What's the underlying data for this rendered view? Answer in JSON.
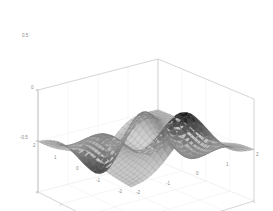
{
  "figure": {
    "title": "",
    "background_color": "#ffffff",
    "axis_line_color": "#c9c9c9",
    "grid_color": "#ededed",
    "tick_label_color": "#8a8a8a",
    "mesh_line_color": "#7a7a7a"
  },
  "axes": {
    "z": {
      "label": "",
      "ticks": [
        "0.5",
        "0",
        "-0.5"
      ],
      "range": [
        -0.5,
        0.5
      ]
    },
    "x": {
      "label": "",
      "ticks": [
        "2",
        "1",
        "0",
        "-1",
        "-2"
      ],
      "range": [
        -2,
        2
      ]
    },
    "y": {
      "label": "",
      "ticks": [
        "-2",
        "-1",
        "0",
        "1",
        "2"
      ],
      "range": [
        -2,
        2
      ]
    }
  },
  "chart_data": {
    "type": "surface",
    "title": "",
    "xlabel": "",
    "ylabel": "",
    "zlabel": "",
    "colormap": "gray",
    "shading": "faceted",
    "grid": true,
    "legend": false,
    "view": {
      "azimuth": -37.5,
      "elevation": 30
    },
    "xlim": [
      -2,
      2
    ],
    "ylim": [
      -2,
      2
    ],
    "zlim": [
      -0.5,
      0.5
    ],
    "grid_n": 30,
    "surface_function": "peaks-like: z = 0.32*(1-x)^2*exp(-x^2-(y+1)^2) - 1.05*(x/5 - x^3 - y^5)*exp(-x^2-y^2) - 0.105*exp(-(x+1)^2-y^2)",
    "features": [
      {
        "name": "primary-peak",
        "x": 0.25,
        "y": 1.55,
        "z": 0.5
      },
      {
        "name": "primary-valley",
        "x": 0.25,
        "y": -1.6,
        "z": -0.5
      },
      {
        "name": "secondary-ridge",
        "x": -1.35,
        "y": 0.25,
        "z": 0.14
      },
      {
        "name": "secondary-dip",
        "x": -0.5,
        "y": -0.6,
        "z": -0.12
      }
    ]
  }
}
